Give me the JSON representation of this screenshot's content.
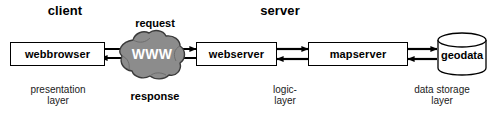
{
  "diagram": {
    "title_client": "client",
    "title_server": "server",
    "colors": {
      "cloud_fill": "#8c8c8c",
      "cloud_stroke": "#3a3a3a",
      "stroke": "#000000",
      "background": "#ffffff",
      "text": "#000000"
    },
    "nodes": [
      {
        "id": "webbrowser",
        "label": "webbrowser",
        "shape": "rectangle"
      },
      {
        "id": "www",
        "label": "WWW",
        "shape": "cloud"
      },
      {
        "id": "webserver",
        "label": "webserver",
        "shape": "rectangle"
      },
      {
        "id": "mapserver",
        "label": "mapserver",
        "shape": "rectangle"
      },
      {
        "id": "geodata",
        "label": "geodata",
        "shape": "cylinder"
      }
    ],
    "flow_labels": {
      "request": "request",
      "response": "response"
    },
    "layer_labels": [
      {
        "id": "presentation",
        "line1": "presentation",
        "line2": "layer"
      },
      {
        "id": "logic",
        "line1": "logic-",
        "line2": "layer"
      },
      {
        "id": "storage",
        "line1": "data storage",
        "line2": "layer"
      }
    ],
    "connectors": [
      {
        "id": "browser-to-www",
        "direction": "bidirectional"
      },
      {
        "id": "www-to-webserver",
        "direction": "bidirectional"
      },
      {
        "id": "webserver-to-mapserver",
        "direction": "bidirectional"
      },
      {
        "id": "mapserver-to-geodata",
        "direction": "bidirectional"
      }
    ]
  }
}
